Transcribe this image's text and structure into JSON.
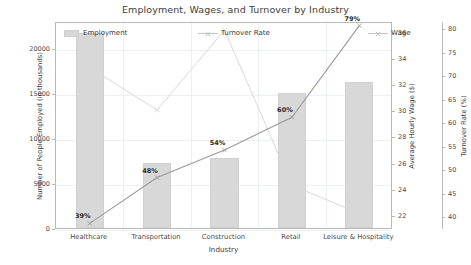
{
  "chart_data": {
    "type": "bar",
    "title": "Employment, Wages, and Turnover by Industry",
    "xlabel": "Industry",
    "ylabel": "Number of People Employed (in thousands)",
    "y2label": "Average Hourly Wage ($)",
    "y3label": "Turnover Rate (%)",
    "categories": [
      "Healthcare",
      "Transportation",
      "Construction",
      "Retail",
      "Leisure & Hospitality"
    ],
    "ylim": [
      0,
      23000
    ],
    "yticks": [
      0,
      5000,
      10000,
      15000,
      20000
    ],
    "y2lim": [
      21,
      36.8
    ],
    "y2ticks": [
      22,
      24,
      26,
      28,
      30,
      32,
      34,
      36
    ],
    "y3lim": [
      37.5,
      81.5
    ],
    "y3ticks": [
      40,
      45,
      50,
      55,
      60,
      65,
      70,
      75,
      80
    ],
    "grid": true,
    "legend_position": "upper inside",
    "series": [
      {
        "name": "Employment",
        "type": "bar",
        "axis": "left",
        "values": [
          21700,
          7200,
          7800,
          15000,
          16200
        ]
      },
      {
        "name": "Wage",
        "type": "line",
        "axis": "right-1",
        "values": [
          21.5,
          25.0,
          27.1,
          29.6,
          36.6
        ],
        "point_labels": [
          "39%",
          "48%",
          "54%",
          "60%",
          "79%"
        ]
      },
      {
        "name": "Turnover Rate",
        "type": "line",
        "axis": "right-2",
        "values": [
          72,
          63,
          80,
          47,
          41
        ]
      }
    ],
    "annotations": [
      {
        "text": "39%",
        "category": "Healthcare"
      },
      {
        "text": "48%",
        "category": "Transportation"
      },
      {
        "text": "54%",
        "category": "Construction"
      },
      {
        "text": "60%",
        "category": "Retail"
      },
      {
        "text": "79%",
        "category": "Leisure & Hospitality"
      }
    ],
    "colors": {
      "bar": "#d8d8d8",
      "wage_line": "#9a9a9a",
      "turnover_line": "#d9d9d9",
      "text": "#3d3d3d",
      "grid": "#eceff3",
      "spine": "#b9b9b9"
    },
    "legend": [
      {
        "label": "Employment",
        "marker": "bar-swatch"
      },
      {
        "label": "Turnover Rate",
        "marker": "line-marker"
      },
      {
        "label": "Wage",
        "marker": "line-marker"
      }
    ]
  }
}
